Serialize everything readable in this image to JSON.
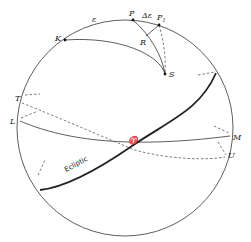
{
  "diagram": {
    "points": {
      "P": "P",
      "P1": "P",
      "P1_sub": "1",
      "K": "K",
      "R": "R",
      "S": "S",
      "T": "T",
      "L": "L",
      "M": "M",
      "U": "U",
      "vernal_equinox": "♈"
    },
    "arc_labels": {
      "epsilon": "ε",
      "delta_epsilon": "Δε"
    },
    "ecliptic_label": "Ecliptic",
    "colors": {
      "stroke": "#222222",
      "background": "#ffffff"
    }
  }
}
